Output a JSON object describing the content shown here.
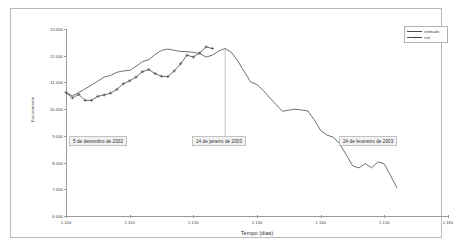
{
  "figure": {
    "xlabel": "Tempo (dias)",
    "ylabel": "Escoamento"
  },
  "legend": {
    "position": "top-right",
    "entries": [
      {
        "label": "estimado",
        "style": "line",
        "color": "#4a4a4a"
      },
      {
        "label": "real",
        "style": "line-marker",
        "marker": "+",
        "color": "#4a4a4a"
      }
    ]
  },
  "annotations": [
    {
      "name": "annotation-left",
      "text": "5 de dezembro de 2002",
      "x": 1100,
      "left_px": 58,
      "top_px": 127
    },
    {
      "name": "annotation-middle",
      "text": "14 de janeiro de 2003",
      "x": 1125,
      "left_px": 181,
      "top_px": 127,
      "leader_line": true
    },
    {
      "name": "annotation-right",
      "text": "24 de fevereiro de 2003",
      "x": 1152,
      "left_px": 328,
      "top_px": 127
    }
  ],
  "axes": {
    "y_ticks": [
      "6.000",
      "7.000",
      "8.000",
      "9.000",
      "10.000",
      "11.000",
      "12.000",
      "13.000"
    ],
    "x_ticks": [
      "1.100",
      "1.110",
      "1.120",
      "1.130",
      "1.140",
      "1.150",
      "1.160"
    ]
  },
  "chart_data": {
    "type": "line",
    "title": "",
    "subtitle": "",
    "xlabel": "Tempo (dias)",
    "ylabel": "Escoamento",
    "xlim": [
      1100,
      1160
    ],
    "ylim": [
      6000,
      13000
    ],
    "grid": false,
    "legend_position": "top-right",
    "x_tick_values": [
      1100,
      1110,
      1120,
      1130,
      1140,
      1150,
      1160
    ],
    "x_tick_labels": [
      "1.100",
      "1.110",
      "1.120",
      "1.130",
      "1.140",
      "1.150",
      "1.160"
    ],
    "y_tick_values": [
      6000,
      7000,
      8000,
      9000,
      10000,
      11000,
      12000,
      13000
    ],
    "y_tick_labels": [
      "6.000",
      "7.000",
      "8.000",
      "9.000",
      "10.000",
      "11.000",
      "12.000",
      "13.000"
    ],
    "annotations": [
      {
        "text": "5 de dezembro de 2002",
        "x": 1100,
        "y": 9000
      },
      {
        "text": "14 de janeiro de 2003",
        "x": 1125,
        "y": 9000
      },
      {
        "text": "24 de fevereiro de 2003",
        "x": 1152,
        "y": 9000
      }
    ],
    "series": [
      {
        "name": "estimado",
        "marker": "none",
        "color": "#4a4a4a",
        "x": [
          1100,
          1101,
          1102,
          1103,
          1104,
          1105,
          1106,
          1107,
          1108,
          1109,
          1110,
          1111,
          1112,
          1113,
          1114,
          1115,
          1116,
          1117,
          1118,
          1119,
          1120,
          1121,
          1122,
          1123,
          1124,
          1125,
          1126,
          1127,
          1128,
          1129,
          1130,
          1131,
          1132,
          1133,
          1134,
          1135,
          1136,
          1137,
          1138,
          1139,
          1140,
          1141,
          1142,
          1143,
          1144,
          1145,
          1146,
          1147,
          1148,
          1149,
          1150,
          1151,
          1152
        ],
        "y": [
          10620,
          10500,
          10620,
          10760,
          10900,
          11050,
          11200,
          11260,
          11380,
          11430,
          11450,
          11600,
          11780,
          11850,
          12050,
          12200,
          12250,
          12200,
          12160,
          12150,
          12130,
          12080,
          11950,
          12020,
          12180,
          12270,
          12120,
          11800,
          11400,
          11020,
          10920,
          10700,
          10420,
          10170,
          9920,
          9960,
          10000,
          9970,
          9930,
          9600,
          9200,
          9030,
          8950,
          8700,
          8300,
          7880,
          7800,
          7960,
          7800,
          8030,
          7950,
          7500,
          7050
        ]
      },
      {
        "name": "real",
        "marker": "+",
        "color": "#4a4a4a",
        "x": [
          1100,
          1101,
          1102,
          1103,
          1104,
          1105,
          1106,
          1107,
          1108,
          1109,
          1110,
          1111,
          1112,
          1113,
          1114,
          1115,
          1116,
          1117,
          1118,
          1119,
          1120,
          1121,
          1122,
          1123
        ],
        "y": [
          10620,
          10420,
          10550,
          10330,
          10330,
          10480,
          10530,
          10600,
          10740,
          10950,
          11060,
          11200,
          11400,
          11480,
          11330,
          11230,
          11220,
          11430,
          11700,
          12020,
          11950,
          12100,
          12330,
          12270
        ]
      }
    ]
  }
}
